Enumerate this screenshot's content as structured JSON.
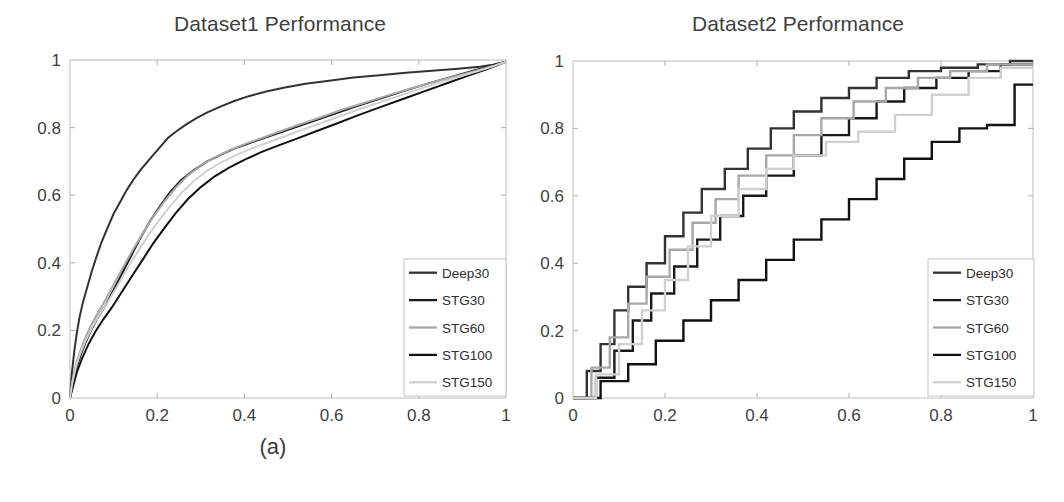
{
  "figure": {
    "caption_a": "(a)",
    "caption_b": "(b)",
    "background": "#ffffff"
  },
  "series_colors": {
    "Deep30": "#333333",
    "STG30": "#1a1a1a",
    "STG60": "#a8a8a8",
    "STG100": "#111111",
    "STG150": "#d0d0d0"
  },
  "chart_data": [
    {
      "type": "line",
      "panel": "a",
      "title": "Dataset1 Performance",
      "xlabel": "",
      "ylabel": "",
      "xlim": [
        0,
        1
      ],
      "ylim": [
        0,
        1
      ],
      "xticks": [
        "0",
        "0.2",
        "0.4",
        "0.6",
        "0.8",
        "1"
      ],
      "yticks": [
        "0",
        "0.2",
        "0.4",
        "0.6",
        "0.8",
        "1"
      ],
      "xtick_values": [
        0,
        0.2,
        0.4,
        0.6,
        0.8,
        1
      ],
      "ytick_values": [
        0,
        0.2,
        0.4,
        0.6,
        0.8,
        1
      ],
      "grid": false,
      "legend_position": "lower-right",
      "legend": [
        "Deep30",
        "STG30",
        "STG60",
        "STG100",
        "STG150"
      ],
      "series": [
        {
          "name": "Deep30",
          "color": "#333333",
          "x": [
            0.0,
            0.004,
            0.01,
            0.016,
            0.022,
            0.03,
            0.04,
            0.05,
            0.06,
            0.072,
            0.085,
            0.1,
            0.115,
            0.13,
            0.145,
            0.16,
            0.175,
            0.19,
            0.205,
            0.225,
            0.245,
            0.265,
            0.29,
            0.315,
            0.345,
            0.375,
            0.41,
            0.45,
            0.49,
            0.54,
            0.59,
            0.65,
            0.71,
            0.77,
            0.83,
            0.89,
            0.94,
            0.97,
            1.0
          ],
          "y": [
            0.0,
            0.07,
            0.14,
            0.195,
            0.24,
            0.285,
            0.33,
            0.375,
            0.415,
            0.46,
            0.5,
            0.545,
            0.58,
            0.615,
            0.645,
            0.672,
            0.695,
            0.718,
            0.74,
            0.77,
            0.79,
            0.808,
            0.828,
            0.845,
            0.862,
            0.878,
            0.893,
            0.907,
            0.918,
            0.93,
            0.938,
            0.948,
            0.955,
            0.962,
            0.968,
            0.974,
            0.98,
            0.986,
            0.995
          ]
        },
        {
          "name": "STG30",
          "color": "#1a1a1a",
          "x": [
            0.0,
            0.006,
            0.014,
            0.024,
            0.036,
            0.05,
            0.065,
            0.082,
            0.1,
            0.12,
            0.14,
            0.16,
            0.182,
            0.205,
            0.23,
            0.255,
            0.285,
            0.315,
            0.35,
            0.385,
            0.425,
            0.465,
            0.51,
            0.555,
            0.605,
            0.655,
            0.71,
            0.765,
            0.82,
            0.875,
            0.925,
            0.965,
            1.0
          ],
          "y": [
            0.0,
            0.04,
            0.085,
            0.125,
            0.165,
            0.205,
            0.24,
            0.275,
            0.32,
            0.37,
            0.42,
            0.47,
            0.52,
            0.565,
            0.61,
            0.645,
            0.675,
            0.7,
            0.722,
            0.742,
            0.76,
            0.778,
            0.798,
            0.818,
            0.84,
            0.862,
            0.885,
            0.908,
            0.93,
            0.95,
            0.968,
            0.982,
            0.995
          ]
        },
        {
          "name": "STG60",
          "color": "#a8a8a8",
          "x": [
            0.0,
            0.005,
            0.012,
            0.022,
            0.034,
            0.048,
            0.064,
            0.082,
            0.102,
            0.124,
            0.146,
            0.168,
            0.192,
            0.216,
            0.242,
            0.27,
            0.3,
            0.332,
            0.366,
            0.402,
            0.442,
            0.484,
            0.528,
            0.574,
            0.622,
            0.672,
            0.724,
            0.778,
            0.832,
            0.884,
            0.932,
            0.97,
            1.0
          ],
          "y": [
            0.0,
            0.045,
            0.092,
            0.134,
            0.175,
            0.215,
            0.252,
            0.292,
            0.34,
            0.392,
            0.442,
            0.49,
            0.538,
            0.58,
            0.622,
            0.658,
            0.688,
            0.712,
            0.733,
            0.752,
            0.77,
            0.79,
            0.81,
            0.83,
            0.852,
            0.872,
            0.893,
            0.914,
            0.934,
            0.952,
            0.968,
            0.982,
            0.995
          ]
        },
        {
          "name": "STG100",
          "color": "#111111",
          "x": [
            0.0,
            0.007,
            0.016,
            0.028,
            0.042,
            0.058,
            0.076,
            0.096,
            0.118,
            0.142,
            0.166,
            0.19,
            0.216,
            0.242,
            0.27,
            0.3,
            0.332,
            0.366,
            0.402,
            0.44,
            0.48,
            0.522,
            0.566,
            0.612,
            0.66,
            0.71,
            0.762,
            0.814,
            0.866,
            0.912,
            0.952,
            0.98,
            1.0
          ],
          "y": [
            0.0,
            0.035,
            0.078,
            0.118,
            0.158,
            0.196,
            0.232,
            0.268,
            0.312,
            0.36,
            0.408,
            0.456,
            0.502,
            0.546,
            0.588,
            0.624,
            0.656,
            0.682,
            0.706,
            0.728,
            0.748,
            0.768,
            0.79,
            0.812,
            0.836,
            0.86,
            0.884,
            0.908,
            0.932,
            0.953,
            0.971,
            0.984,
            0.995
          ]
        },
        {
          "name": "STG150",
          "color": "#d0d0d0",
          "x": [
            0.0,
            0.005,
            0.013,
            0.023,
            0.036,
            0.051,
            0.068,
            0.087,
            0.108,
            0.13,
            0.153,
            0.177,
            0.202,
            0.228,
            0.255,
            0.284,
            0.315,
            0.348,
            0.383,
            0.42,
            0.46,
            0.502,
            0.546,
            0.592,
            0.64,
            0.69,
            0.742,
            0.794,
            0.846,
            0.896,
            0.94,
            0.974,
            1.0
          ],
          "y": [
            0.0,
            0.042,
            0.088,
            0.13,
            0.17,
            0.21,
            0.247,
            0.285,
            0.33,
            0.38,
            0.428,
            0.476,
            0.522,
            0.565,
            0.606,
            0.642,
            0.673,
            0.698,
            0.72,
            0.74,
            0.759,
            0.779,
            0.8,
            0.821,
            0.844,
            0.866,
            0.888,
            0.911,
            0.933,
            0.952,
            0.969,
            0.983,
            0.995
          ]
        }
      ]
    },
    {
      "type": "line",
      "panel": "b",
      "title": "Dataset2 Performance",
      "xlabel": "",
      "ylabel": "",
      "xlim": [
        0,
        1
      ],
      "ylim": [
        0,
        1
      ],
      "xticks": [
        "0",
        "0.2",
        "0.4",
        "0.6",
        "0.8",
        "1"
      ],
      "yticks": [
        "0",
        "0.2",
        "0.4",
        "0.6",
        "0.8",
        "1"
      ],
      "xtick_values": [
        0,
        0.2,
        0.4,
        0.6,
        0.8,
        1
      ],
      "ytick_values": [
        0,
        0.2,
        0.4,
        0.6,
        0.8,
        1
      ],
      "grid": false,
      "legend_position": "lower-right",
      "legend": [
        "Deep30",
        "STG30",
        "STG60",
        "STG100",
        "STG150"
      ],
      "step": true,
      "series": [
        {
          "name": "Deep30",
          "color": "#333333",
          "x": [
            0.0,
            0.03,
            0.03,
            0.06,
            0.06,
            0.09,
            0.09,
            0.12,
            0.12,
            0.16,
            0.16,
            0.2,
            0.2,
            0.24,
            0.24,
            0.28,
            0.28,
            0.33,
            0.33,
            0.38,
            0.38,
            0.43,
            0.43,
            0.48,
            0.48,
            0.54,
            0.54,
            0.6,
            0.6,
            0.66,
            0.66,
            0.73,
            0.73,
            0.8,
            0.8,
            0.88,
            0.88,
            0.95,
            0.95,
            1.0
          ],
          "y": [
            0.0,
            0.0,
            0.08,
            0.08,
            0.16,
            0.16,
            0.26,
            0.26,
            0.33,
            0.33,
            0.4,
            0.4,
            0.48,
            0.48,
            0.55,
            0.55,
            0.62,
            0.62,
            0.68,
            0.68,
            0.74,
            0.74,
            0.8,
            0.8,
            0.85,
            0.85,
            0.89,
            0.89,
            0.92,
            0.92,
            0.95,
            0.95,
            0.97,
            0.97,
            0.98,
            0.98,
            0.99,
            0.99,
            1.0,
            1.0
          ]
        },
        {
          "name": "STG30",
          "color": "#1a1a1a",
          "x": [
            0.0,
            0.05,
            0.05,
            0.09,
            0.09,
            0.13,
            0.13,
            0.17,
            0.17,
            0.22,
            0.22,
            0.27,
            0.27,
            0.32,
            0.32,
            0.37,
            0.37,
            0.42,
            0.42,
            0.48,
            0.48,
            0.54,
            0.54,
            0.6,
            0.6,
            0.66,
            0.66,
            0.72,
            0.72,
            0.79,
            0.79,
            0.86,
            0.86,
            0.93,
            0.93,
            1.0
          ],
          "y": [
            0.0,
            0.0,
            0.06,
            0.06,
            0.14,
            0.14,
            0.23,
            0.23,
            0.31,
            0.31,
            0.39,
            0.39,
            0.47,
            0.47,
            0.54,
            0.54,
            0.6,
            0.6,
            0.66,
            0.66,
            0.72,
            0.72,
            0.78,
            0.78,
            0.83,
            0.83,
            0.88,
            0.88,
            0.92,
            0.92,
            0.95,
            0.95,
            0.97,
            0.97,
            0.99,
            0.99
          ]
        },
        {
          "name": "STG60",
          "color": "#a8a8a8",
          "x": [
            0.0,
            0.04,
            0.04,
            0.08,
            0.08,
            0.12,
            0.12,
            0.16,
            0.16,
            0.21,
            0.21,
            0.26,
            0.26,
            0.31,
            0.31,
            0.36,
            0.36,
            0.42,
            0.42,
            0.48,
            0.48,
            0.54,
            0.54,
            0.61,
            0.61,
            0.68,
            0.68,
            0.75,
            0.75,
            0.82,
            0.82,
            0.9,
            0.9,
            1.0
          ],
          "y": [
            0.0,
            0.0,
            0.09,
            0.09,
            0.18,
            0.18,
            0.28,
            0.28,
            0.36,
            0.36,
            0.44,
            0.44,
            0.52,
            0.52,
            0.59,
            0.59,
            0.66,
            0.66,
            0.72,
            0.72,
            0.78,
            0.78,
            0.83,
            0.83,
            0.88,
            0.88,
            0.92,
            0.92,
            0.95,
            0.95,
            0.97,
            0.97,
            0.99,
            0.99
          ]
        },
        {
          "name": "STG100",
          "color": "#111111",
          "x": [
            0.0,
            0.06,
            0.06,
            0.12,
            0.12,
            0.18,
            0.18,
            0.24,
            0.24,
            0.3,
            0.3,
            0.36,
            0.36,
            0.42,
            0.42,
            0.48,
            0.48,
            0.54,
            0.54,
            0.6,
            0.6,
            0.66,
            0.66,
            0.72,
            0.72,
            0.78,
            0.78,
            0.84,
            0.84,
            0.9,
            0.9,
            0.96,
            0.96,
            1.0
          ],
          "y": [
            0.0,
            0.0,
            0.05,
            0.05,
            0.1,
            0.1,
            0.17,
            0.17,
            0.23,
            0.23,
            0.29,
            0.29,
            0.35,
            0.35,
            0.41,
            0.41,
            0.47,
            0.47,
            0.53,
            0.53,
            0.59,
            0.59,
            0.65,
            0.65,
            0.71,
            0.71,
            0.76,
            0.76,
            0.8,
            0.8,
            0.81,
            0.81,
            0.93,
            0.93
          ]
        },
        {
          "name": "STG150",
          "color": "#d0d0d0",
          "x": [
            0.0,
            0.05,
            0.05,
            0.1,
            0.1,
            0.15,
            0.15,
            0.2,
            0.2,
            0.25,
            0.25,
            0.3,
            0.3,
            0.36,
            0.36,
            0.42,
            0.42,
            0.48,
            0.48,
            0.55,
            0.55,
            0.62,
            0.62,
            0.7,
            0.7,
            0.78,
            0.78,
            0.86,
            0.86,
            0.93,
            0.93,
            1.0
          ],
          "y": [
            0.0,
            0.0,
            0.07,
            0.07,
            0.16,
            0.16,
            0.26,
            0.26,
            0.35,
            0.35,
            0.45,
            0.45,
            0.54,
            0.54,
            0.62,
            0.62,
            0.68,
            0.68,
            0.72,
            0.72,
            0.76,
            0.76,
            0.79,
            0.79,
            0.84,
            0.84,
            0.9,
            0.9,
            0.95,
            0.95,
            0.98,
            0.98
          ]
        }
      ]
    }
  ]
}
